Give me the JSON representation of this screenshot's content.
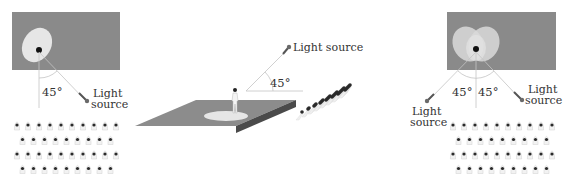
{
  "colors": {
    "screen": "#8a8a8a",
    "spot": "#e6e6e6",
    "stage_top": "#8c8c8c",
    "stage_side": "#4a4a4a",
    "line": "#c4c4c4",
    "text": "#333333",
    "lamp": "#6a6a6a",
    "head": "#2a2a2a",
    "body_outline": "#d8d8d8"
  },
  "panels": {
    "left": {
      "angle_label": "45°",
      "light_label_line1": "Light",
      "light_label_line2": "source",
      "audience_rows": [
        10,
        9,
        10,
        9
      ]
    },
    "center": {
      "angle_label": "45°",
      "light_label": "Light source",
      "audience_rows": [
        7,
        7,
        6,
        5,
        4,
        3,
        2
      ]
    },
    "right": {
      "angle_left_label": "45°",
      "angle_right_label": "45°",
      "left_light_line1": "Light",
      "left_light_line2": "source",
      "right_light_line1": "Light",
      "right_light_line2": "source",
      "audience_rows": [
        10,
        9,
        10,
        9
      ]
    }
  }
}
